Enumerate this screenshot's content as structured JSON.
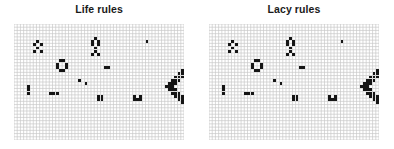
{
  "figure": {
    "width": 394,
    "height": 149,
    "background_color": "#ffffff",
    "grid_line_color": "#c9c9c9",
    "cell_color": "#151515"
  },
  "panels": [
    {
      "id": "life-rules",
      "title": "Life rules",
      "grid": {
        "x": 14,
        "y": 24,
        "width": 170,
        "height": 116,
        "cols": 53,
        "rows": 36,
        "cell_size": 3.2
      }
    },
    {
      "id": "lacy-rules",
      "title": "Lacy rules",
      "grid": {
        "x": 209,
        "y": 24,
        "width": 170,
        "height": 116,
        "cols": 53,
        "rows": 36,
        "cell_size": 3.2
      }
    }
  ],
  "chart_data": {
    "type": "heatmap",
    "title": "",
    "xlabel": "",
    "ylabel": "",
    "grid_cols": 53,
    "grid_rows": 36,
    "legend": [
      {
        "label": "live cell",
        "color": "#151515"
      },
      {
        "label": "dead cell",
        "color": "#ffffff"
      }
    ],
    "panels": [
      {
        "name": "Life rules",
        "live_cells": [
          [
            7,
            5
          ],
          [
            6,
            6
          ],
          [
            8,
            6
          ],
          [
            7,
            7
          ],
          [
            6,
            8
          ],
          [
            8,
            8
          ],
          [
            25,
            4
          ],
          [
            24,
            5
          ],
          [
            26,
            5
          ],
          [
            24,
            6
          ],
          [
            26,
            6
          ],
          [
            25,
            7
          ],
          [
            25,
            8
          ],
          [
            24,
            9
          ],
          [
            26,
            9
          ],
          [
            41,
            5
          ],
          [
            14,
            11
          ],
          [
            15,
            11
          ],
          [
            13,
            12
          ],
          [
            16,
            12
          ],
          [
            13,
            13
          ],
          [
            16,
            13
          ],
          [
            14,
            14
          ],
          [
            15,
            14
          ],
          [
            28,
            13
          ],
          [
            29,
            13
          ],
          [
            20,
            17
          ],
          [
            22,
            18
          ],
          [
            4,
            19
          ],
          [
            4,
            20
          ],
          [
            4,
            21
          ],
          [
            11,
            21
          ],
          [
            12,
            21
          ],
          [
            13,
            21
          ],
          [
            26,
            22
          ],
          [
            27,
            22
          ],
          [
            26,
            23
          ],
          [
            27,
            23
          ],
          [
            37,
            22
          ],
          [
            39,
            22
          ],
          [
            37,
            23
          ],
          [
            38,
            23
          ],
          [
            39,
            23
          ],
          [
            55,
            12
          ],
          [
            56,
            12
          ],
          [
            57,
            12
          ],
          [
            54,
            13
          ],
          [
            55,
            13
          ],
          [
            56,
            13
          ],
          [
            57,
            13
          ],
          [
            58,
            13
          ],
          [
            52,
            14
          ],
          [
            53,
            14
          ],
          [
            54,
            14
          ],
          [
            58,
            14
          ],
          [
            59,
            14
          ],
          [
            60,
            14
          ],
          [
            51,
            15
          ],
          [
            52,
            15
          ],
          [
            53,
            15
          ],
          [
            55,
            15
          ],
          [
            59,
            15
          ],
          [
            60,
            15
          ],
          [
            61,
            15
          ],
          [
            50,
            16
          ],
          [
            51,
            16
          ],
          [
            52,
            16
          ],
          [
            61,
            16
          ],
          [
            62,
            16
          ],
          [
            49,
            17
          ],
          [
            50,
            17
          ],
          [
            51,
            17
          ],
          [
            55,
            17
          ],
          [
            62,
            17
          ],
          [
            63,
            17
          ],
          [
            48,
            18
          ],
          [
            49,
            18
          ],
          [
            50,
            18
          ],
          [
            54,
            18
          ],
          [
            56,
            18
          ],
          [
            63,
            18
          ],
          [
            64,
            18
          ],
          [
            47,
            19
          ],
          [
            48,
            19
          ],
          [
            49,
            19
          ],
          [
            53,
            19
          ],
          [
            55,
            19
          ],
          [
            57,
            19
          ],
          [
            64,
            19
          ],
          [
            65,
            19
          ],
          [
            48,
            20
          ],
          [
            49,
            20
          ],
          [
            50,
            20
          ],
          [
            54,
            20
          ],
          [
            56,
            20
          ],
          [
            63,
            20
          ],
          [
            64,
            20
          ],
          [
            49,
            21
          ],
          [
            50,
            21
          ],
          [
            51,
            21
          ],
          [
            55,
            21
          ],
          [
            62,
            21
          ],
          [
            63,
            21
          ],
          [
            50,
            22
          ],
          [
            51,
            22
          ],
          [
            52,
            22
          ],
          [
            61,
            22
          ],
          [
            62,
            22
          ],
          [
            51,
            23
          ],
          [
            52,
            23
          ],
          [
            53,
            23
          ],
          [
            59,
            23
          ],
          [
            60,
            23
          ],
          [
            61,
            23
          ],
          [
            52,
            24
          ],
          [
            53,
            24
          ],
          [
            54,
            24
          ],
          [
            58,
            24
          ],
          [
            59,
            24
          ],
          [
            60,
            24
          ],
          [
            54,
            25
          ],
          [
            55,
            25
          ],
          [
            56,
            25
          ],
          [
            57,
            25
          ],
          [
            58,
            25
          ],
          [
            55,
            26
          ],
          [
            56,
            26
          ],
          [
            57,
            26
          ]
        ]
      },
      {
        "name": "Lacy rules",
        "live_cells": [
          [
            7,
            5
          ],
          [
            6,
            6
          ],
          [
            8,
            6
          ],
          [
            7,
            7
          ],
          [
            6,
            8
          ],
          [
            8,
            8
          ],
          [
            25,
            4
          ],
          [
            24,
            5
          ],
          [
            26,
            5
          ],
          [
            24,
            6
          ],
          [
            26,
            6
          ],
          [
            25,
            7
          ],
          [
            25,
            8
          ],
          [
            24,
            9
          ],
          [
            26,
            9
          ],
          [
            41,
            5
          ],
          [
            14,
            11
          ],
          [
            15,
            11
          ],
          [
            13,
            12
          ],
          [
            16,
            12
          ],
          [
            13,
            13
          ],
          [
            16,
            13
          ],
          [
            14,
            14
          ],
          [
            15,
            14
          ],
          [
            28,
            13
          ],
          [
            29,
            13
          ],
          [
            20,
            17
          ],
          [
            22,
            18
          ],
          [
            4,
            19
          ],
          [
            4,
            20
          ],
          [
            4,
            21
          ],
          [
            11,
            21
          ],
          [
            12,
            21
          ],
          [
            13,
            21
          ],
          [
            26,
            22
          ],
          [
            27,
            22
          ],
          [
            26,
            23
          ],
          [
            27,
            23
          ],
          [
            37,
            22
          ],
          [
            39,
            22
          ],
          [
            37,
            23
          ],
          [
            38,
            23
          ],
          [
            39,
            23
          ],
          [
            55,
            12
          ],
          [
            56,
            12
          ],
          [
            57,
            12
          ],
          [
            54,
            13
          ],
          [
            55,
            13
          ],
          [
            56,
            13
          ],
          [
            57,
            13
          ],
          [
            58,
            13
          ],
          [
            52,
            14
          ],
          [
            53,
            14
          ],
          [
            54,
            14
          ],
          [
            58,
            14
          ],
          [
            59,
            14
          ],
          [
            60,
            14
          ],
          [
            51,
            15
          ],
          [
            52,
            15
          ],
          [
            53,
            15
          ],
          [
            55,
            15
          ],
          [
            59,
            15
          ],
          [
            60,
            15
          ],
          [
            61,
            15
          ],
          [
            50,
            16
          ],
          [
            51,
            16
          ],
          [
            52,
            16
          ],
          [
            61,
            16
          ],
          [
            62,
            16
          ],
          [
            49,
            17
          ],
          [
            50,
            17
          ],
          [
            51,
            17
          ],
          [
            55,
            17
          ],
          [
            62,
            17
          ],
          [
            63,
            17
          ],
          [
            48,
            18
          ],
          [
            49,
            18
          ],
          [
            50,
            18
          ],
          [
            54,
            18
          ],
          [
            56,
            18
          ],
          [
            63,
            18
          ],
          [
            64,
            18
          ],
          [
            47,
            19
          ],
          [
            48,
            19
          ],
          [
            49,
            19
          ],
          [
            53,
            19
          ],
          [
            55,
            19
          ],
          [
            57,
            19
          ],
          [
            64,
            19
          ],
          [
            65,
            19
          ],
          [
            48,
            20
          ],
          [
            49,
            20
          ],
          [
            50,
            20
          ],
          [
            54,
            20
          ],
          [
            56,
            20
          ],
          [
            63,
            20
          ],
          [
            64,
            20
          ],
          [
            49,
            21
          ],
          [
            50,
            21
          ],
          [
            51,
            21
          ],
          [
            55,
            21
          ],
          [
            62,
            21
          ],
          [
            63,
            21
          ],
          [
            50,
            22
          ],
          [
            51,
            22
          ],
          [
            52,
            22
          ],
          [
            61,
            22
          ],
          [
            62,
            22
          ],
          [
            51,
            23
          ],
          [
            52,
            23
          ],
          [
            53,
            23
          ],
          [
            59,
            23
          ],
          [
            60,
            23
          ],
          [
            61,
            23
          ],
          [
            52,
            24
          ],
          [
            53,
            24
          ],
          [
            54,
            24
          ],
          [
            58,
            24
          ],
          [
            59,
            24
          ],
          [
            60,
            24
          ],
          [
            54,
            25
          ],
          [
            55,
            25
          ],
          [
            56,
            25
          ],
          [
            57,
            25
          ],
          [
            58,
            25
          ],
          [
            55,
            26
          ],
          [
            56,
            26
          ],
          [
            57,
            26
          ]
        ]
      }
    ]
  }
}
